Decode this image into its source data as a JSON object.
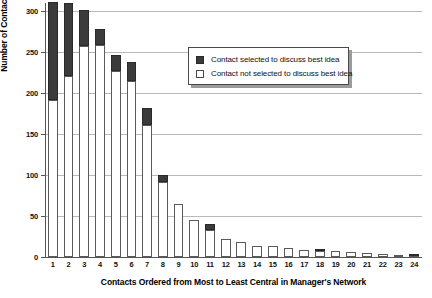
{
  "chart_data": {
    "type": "bar",
    "stacked": true,
    "title": "",
    "xlabel": "Contacts Ordered from Most to Least Central in Manager's Network",
    "ylabel": "Number of Contacts",
    "ylim": [
      0,
      310
    ],
    "ytick_values": [
      0,
      50,
      100,
      150,
      200,
      250,
      300
    ],
    "ytick_labels": [
      "0",
      "50",
      "100",
      "150",
      "200",
      "250",
      "300"
    ],
    "grid": true,
    "grid_axis": "y",
    "legend_position": "upper right",
    "categories": [
      "1",
      "2",
      "3",
      "4",
      "5",
      "6",
      "7",
      "8",
      "9",
      "10",
      "11",
      "12",
      "13",
      "14",
      "15",
      "16",
      "17",
      "18",
      "19",
      "20",
      "21",
      "22",
      "23",
      "24"
    ],
    "series": [
      {
        "name": "Contact not selected to discuss best idea",
        "color": "#ffffff",
        "values": [
          192,
          221,
          257,
          259,
          227,
          215,
          161,
          92,
          65,
          45,
          33,
          22,
          18,
          13,
          13,
          11,
          9,
          7,
          7,
          6,
          5,
          4,
          2,
          1
        ]
      },
      {
        "name": "Contact selected to discuss best idea",
        "color": "#3b3b3b",
        "values": [
          119,
          89,
          44,
          19,
          20,
          23,
          21,
          8,
          0,
          0,
          7,
          0,
          0,
          0,
          0,
          0,
          0,
          2,
          0,
          0,
          0,
          0,
          0,
          1
        ]
      }
    ],
    "totals": [
      311,
      310,
      301,
      278,
      247,
      238,
      182,
      100,
      65,
      45,
      40,
      22,
      18,
      13,
      13,
      11,
      9,
      9,
      7,
      6,
      5,
      4,
      2,
      2
    ]
  },
  "legend": {
    "entries": [
      {
        "label": "Contact selected to discuss best idea",
        "swatch": "dark"
      },
      {
        "label": "Contact not selected to discuss best idea",
        "swatch": "light"
      }
    ]
  }
}
